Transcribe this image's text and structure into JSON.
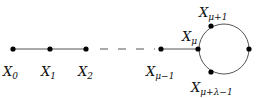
{
  "diagram": {
    "title": "",
    "nodes": [
      {
        "id": "X0",
        "base": "X",
        "sub": "0",
        "x": 13,
        "y": 49,
        "lx": 3,
        "ly": 76
      },
      {
        "id": "X1",
        "base": "X",
        "sub": "1",
        "x": 50,
        "y": 49,
        "lx": 41,
        "ly": 76
      },
      {
        "id": "X2",
        "base": "X",
        "sub": "2",
        "x": 86,
        "y": 49,
        "lx": 78,
        "ly": 76
      },
      {
        "id": "Xmu-1",
        "base": "X",
        "sub": "μ−1",
        "x": 161,
        "y": 49,
        "lx": 146,
        "ly": 76
      },
      {
        "id": "Xmu",
        "base": "X",
        "sub": "μ",
        "x": 198,
        "y": 49,
        "lx": 182,
        "ly": 41
      },
      {
        "id": "Xmu+1",
        "base": "X",
        "sub": "μ+1",
        "x": 211,
        "y": 26,
        "lx": 199,
        "ly": 17
      },
      {
        "id": "Xright",
        "base": "",
        "sub": "",
        "x": 249,
        "y": 49,
        "lx": 0,
        "ly": 0
      },
      {
        "id": "Xmu+lambda-1",
        "base": "X",
        "sub": "μ+λ−1",
        "x": 211,
        "y": 72,
        "lx": 191,
        "ly": 92
      }
    ],
    "edges": [
      {
        "from": "X0",
        "to": "X1",
        "style": "solid"
      },
      {
        "from": "X1",
        "to": "X2",
        "style": "solid"
      },
      {
        "from": "X2",
        "to": "Xmu-1",
        "style": "dashed"
      },
      {
        "from": "Xmu-1",
        "to": "Xmu",
        "style": "solid"
      }
    ],
    "cycle": {
      "cx": 224,
      "cy": 49,
      "r": 25
    },
    "colors": {
      "line": "#555555",
      "node": "#000000"
    }
  }
}
